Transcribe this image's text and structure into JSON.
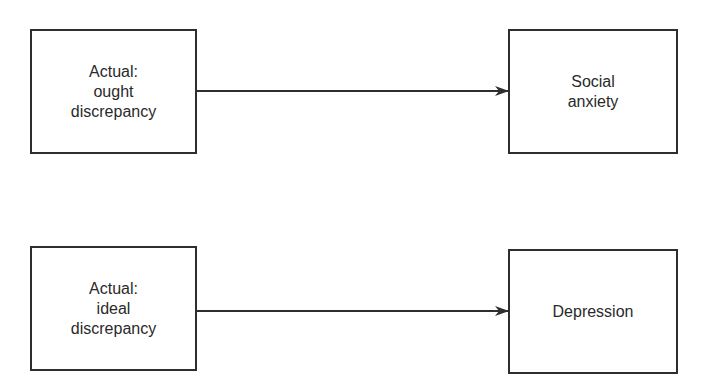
{
  "diagram": {
    "rows": [
      {
        "source": {
          "label": "Actual:\nought\ndiscrepancy"
        },
        "target": {
          "label": "Social\nanxiety"
        }
      },
      {
        "source": {
          "label": "Actual:\nideal\ndiscrepancy"
        },
        "target": {
          "label": "Depression"
        }
      }
    ],
    "colors": {
      "stroke": "#2e2e2e",
      "text": "#2a2a2a",
      "background": "#ffffff"
    }
  }
}
